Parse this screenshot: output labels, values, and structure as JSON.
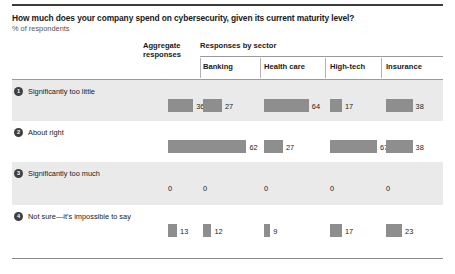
{
  "title": "How much does your company spend on cybersecurity, given its current maturity level?",
  "subtitle": "% of respondents",
  "header": {
    "aggregate": "Aggregate\nresponses",
    "aggregate_line1": "Aggregate",
    "aggregate_line2": "responses",
    "sector_group": "Responses by sector",
    "columns": [
      "Banking",
      "Health care",
      "High-tech",
      "Insurance"
    ]
  },
  "colors": {
    "bar": "#8e8e8e",
    "row_shaded": "#eaeaea",
    "badge": "#3f3f3f",
    "rule_dark": "#3c3c3c",
    "rule_light": "#9a9a9a"
  },
  "rows": [
    {
      "number": "1",
      "label": "Significantly too little",
      "values": [
        36,
        27,
        64,
        17,
        38
      ]
    },
    {
      "number": "2",
      "label": "About right",
      "values": [
        51,
        62,
        27,
        67,
        38
      ]
    },
    {
      "number": "3",
      "label": "Significantly too much",
      "values": [
        0,
        0,
        0,
        0,
        0
      ]
    },
    {
      "number": "4",
      "label": "Not sure—it's impossible to say",
      "values": [
        13,
        12,
        9,
        17,
        23
      ]
    }
  ],
  "chart_data": {
    "type": "bar",
    "title": "How much does your company spend on cybersecurity, given its current maturity level?",
    "subtitle": "% of respondents",
    "xlabel": "",
    "ylabel": "% of respondents",
    "categories": [
      "Significantly too little",
      "About right",
      "Significantly too much",
      "Not sure—it's impossible to say"
    ],
    "series": [
      {
        "name": "Aggregate responses",
        "values": [
          36,
          51,
          0,
          13
        ]
      },
      {
        "name": "Banking",
        "values": [
          27,
          62,
          0,
          12
        ]
      },
      {
        "name": "Health care",
        "values": [
          64,
          27,
          0,
          9
        ]
      },
      {
        "name": "High-tech",
        "values": [
          17,
          67,
          0,
          17
        ]
      },
      {
        "name": "Insurance",
        "values": [
          38,
          38,
          0,
          23
        ]
      }
    ],
    "xlim": [
      0,
      100
    ],
    "grid": false,
    "legend": "none",
    "orientation": "horizontal"
  }
}
